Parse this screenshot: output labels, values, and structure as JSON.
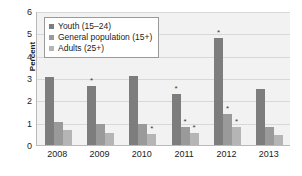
{
  "chart_data": {
    "type": "bar",
    "title": "",
    "subtitle": "",
    "xlabel": "",
    "ylabel": "Percent",
    "categories": [
      "2008",
      "2009",
      "2010",
      "2011",
      "2012",
      "2013"
    ],
    "ylim": [
      0,
      6
    ],
    "yticks": [
      0,
      1,
      2,
      3,
      4,
      5,
      6
    ],
    "grid": true,
    "legend_position": "upper-left-inside",
    "annotation_symbol": "*",
    "annotation_meaning": "statistically significant",
    "series": [
      {
        "name": "Youth (15–24)",
        "color": "#7d7d7d",
        "values": [
          3.05,
          2.65,
          3.1,
          2.3,
          4.8,
          2.5
        ],
        "markers": [
          false,
          true,
          false,
          true,
          true,
          false
        ]
      },
      {
        "name": "General population (15+)",
        "color": "#9a9a9a",
        "values": [
          1.05,
          0.95,
          0.95,
          0.8,
          1.4,
          0.8
        ],
        "markers": [
          false,
          false,
          false,
          true,
          true,
          false
        ]
      },
      {
        "name": "Adults (25+)",
        "color": "#b5b5b5",
        "values": [
          0.65,
          0.55,
          0.5,
          0.55,
          0.8,
          0.45
        ],
        "markers": [
          false,
          false,
          true,
          true,
          true,
          false
        ]
      }
    ]
  },
  "legend": {
    "items": [
      {
        "label": "Youth (15–24)",
        "color": "#7d7d7d"
      },
      {
        "label": "General population (15+)",
        "color": "#9a9a9a"
      },
      {
        "label": "Adults (25+)",
        "color": "#b5b5b5"
      }
    ]
  },
  "axes": {
    "y_title": "Percent",
    "y_tick_labels": [
      "0",
      "1",
      "2",
      "3",
      "4",
      "5",
      "6"
    ],
    "x_tick_labels": [
      "2008",
      "2009",
      "2010",
      "2011",
      "2012",
      "2013"
    ]
  }
}
